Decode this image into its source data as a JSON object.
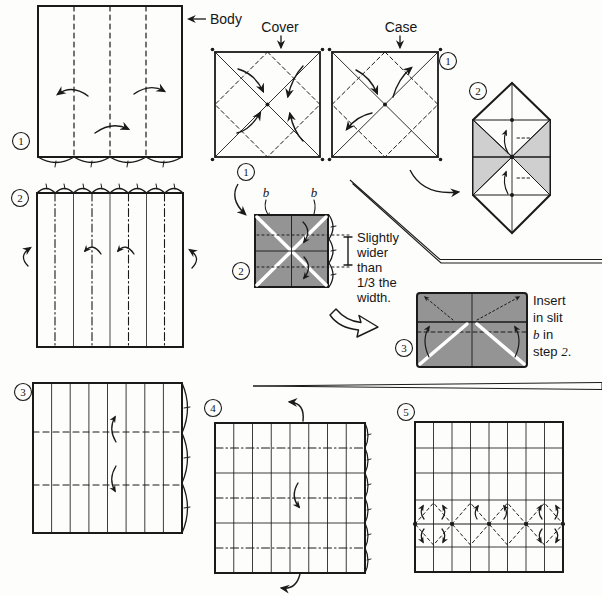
{
  "labels": {
    "body": "Body",
    "cover": "Cover",
    "case": "Case"
  },
  "slit_labels": {
    "left": "b",
    "right": "b"
  },
  "notes": {
    "width": {
      "l1": "Slightly",
      "l2": "wider",
      "l3": "than",
      "l4": "1/3 the",
      "l5": "width."
    },
    "insert": {
      "l1": "Insert",
      "l2": "in slit",
      "l3a": "b",
      "l3b": " in",
      "l4a": "step ",
      "l4b": "2",
      "l4c": "."
    }
  },
  "step_badges": {
    "body_1": "1",
    "body_2": "2",
    "body_3": "3",
    "cover_1": "1",
    "cover_2": "2",
    "cover_3": "3",
    "case_1": "1",
    "case_2": "2",
    "step_4": "4",
    "step_5": "5"
  },
  "colors": {
    "paper_dark": "#949494",
    "paper_light": "#cfcfcf",
    "ink": "#1a1a1a",
    "background": "#fdfdfc"
  }
}
